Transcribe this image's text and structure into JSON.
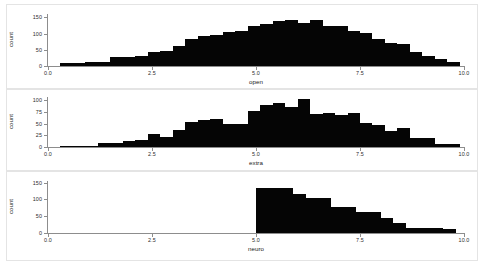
{
  "figure": {
    "background": "#ffffff",
    "bar_color": "#050505",
    "axis_color": "#8d8d8d",
    "panel_border_color": "#e4e4e4"
  },
  "chart_data": [
    {
      "type": "bar",
      "title": "",
      "xlabel": "open",
      "ylabel": "count",
      "xlim": [
        0,
        10
      ],
      "ylim": [
        0,
        160
      ],
      "grid": false,
      "legend": null,
      "xticks": [
        "0.0",
        "2.5",
        "5.0",
        "7.5",
        "10.0"
      ],
      "xtick_values": [
        0.0,
        2.5,
        5.0,
        7.5,
        10.0
      ],
      "yticks": [
        "0",
        "50",
        "100",
        "150"
      ],
      "ytick_values": [
        0,
        50,
        100,
        150
      ],
      "bin_edges": [
        0.3,
        0.6,
        0.9,
        1.2,
        1.5,
        1.8,
        2.1,
        2.4,
        2.7,
        3.0,
        3.3,
        3.6,
        3.9,
        4.2,
        4.5,
        4.8,
        5.1,
        5.4,
        5.7,
        6.0,
        6.3,
        6.6,
        6.9,
        7.2,
        7.5,
        7.8,
        8.1,
        8.4,
        8.7,
        9.0,
        9.3,
        9.6,
        9.9
      ],
      "values": [
        10,
        10,
        12,
        13,
        28,
        27,
        30,
        43,
        45,
        63,
        84,
        93,
        96,
        105,
        108,
        124,
        130,
        140,
        143,
        133,
        142,
        124,
        124,
        109,
        101,
        82,
        71,
        68,
        42,
        31,
        22,
        12
      ]
    },
    {
      "type": "bar",
      "title": "",
      "xlabel": "extra",
      "ylabel": "count",
      "xlim": [
        0,
        10
      ],
      "ylim": [
        0,
        107
      ],
      "grid": false,
      "legend": null,
      "xticks": [
        "0.0",
        "2.5",
        "5.0",
        "7.5",
        "10.0"
      ],
      "xtick_values": [
        0.0,
        2.5,
        5.0,
        7.5,
        10.0
      ],
      "yticks": [
        "0",
        "25",
        "50",
        "75",
        "100"
      ],
      "ytick_values": [
        0,
        25,
        50,
        75,
        100
      ],
      "bin_edges": [
        0.3,
        0.6,
        0.9,
        1.2,
        1.5,
        1.8,
        2.1,
        2.4,
        2.7,
        3.0,
        3.3,
        3.6,
        3.9,
        4.2,
        4.5,
        4.8,
        5.1,
        5.4,
        5.7,
        6.0,
        6.3,
        6.6,
        6.9,
        7.2,
        7.5,
        7.8,
        8.1,
        8.4,
        8.7,
        9.0,
        9.3,
        9.6,
        9.9
      ],
      "values": [
        2,
        2,
        3,
        9,
        9,
        12,
        16,
        27,
        22,
        37,
        53,
        57,
        61,
        50,
        50,
        78,
        89,
        95,
        85,
        102,
        71,
        73,
        68,
        72,
        52,
        47,
        34,
        40,
        19,
        19,
        6,
        6
      ]
    },
    {
      "type": "bar",
      "title": "",
      "xlabel": "neuro",
      "ylabel": "count",
      "xlim": [
        0,
        10
      ],
      "ylim": [
        0,
        155
      ],
      "grid": false,
      "legend": null,
      "xticks": [
        "0.0",
        "2.5",
        "5.0",
        "7.5",
        "10.0"
      ],
      "xtick_values": [
        0.0,
        2.5,
        5.0,
        7.5,
        10.0
      ],
      "yticks": [
        "0",
        "50",
        "100",
        "150"
      ],
      "ytick_values": [
        0,
        50,
        100,
        150
      ],
      "bin_edges": [
        5.0,
        5.3,
        5.6,
        5.9,
        6.2,
        6.5,
        6.8,
        7.1,
        7.4,
        7.7,
        8.0,
        8.3,
        8.6,
        8.9,
        9.2,
        9.5,
        9.8
      ],
      "values": [
        133,
        133,
        133,
        116,
        103,
        103,
        78,
        78,
        62,
        62,
        44,
        30,
        16,
        16,
        16,
        11
      ]
    }
  ]
}
